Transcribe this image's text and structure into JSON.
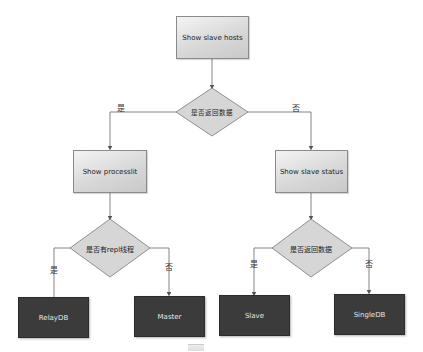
{
  "diagram": {
    "start": {
      "label": "Show slave hosts"
    },
    "decision_1": {
      "label": "是否返回数据",
      "yes": "是",
      "no": "否"
    },
    "left_process": {
      "label": "Show processlit"
    },
    "right_process": {
      "label": "Show slave status"
    },
    "decision_left": {
      "label": "是否有repl线程",
      "yes": "是",
      "no": "否"
    },
    "decision_right": {
      "label": "是否返回数据",
      "yes": "是",
      "no": "否"
    },
    "outcomes": [
      {
        "label": "RelayDB"
      },
      {
        "label": "Master"
      },
      {
        "label": "Slave"
      },
      {
        "label": "SingleDB"
      }
    ],
    "colors": {
      "process_fill": "#d8d8d8",
      "terminal_fill": "#3b3b3b",
      "line": "#555555"
    }
  }
}
